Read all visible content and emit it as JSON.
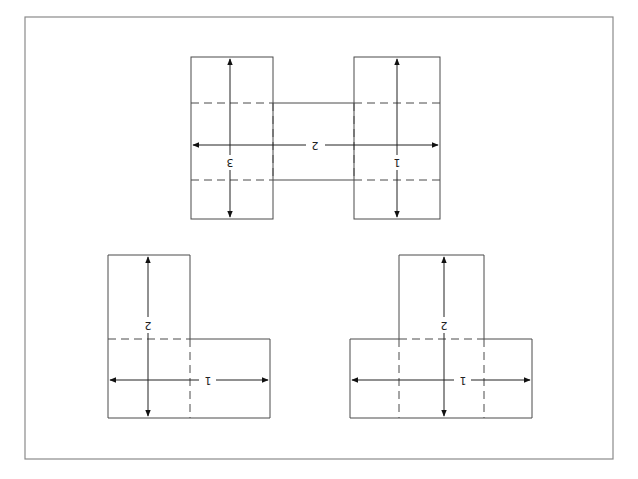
{
  "diagram": {
    "orientation_note": "labels rendered rotated 180°",
    "frame": {
      "x": 25,
      "y": 17,
      "w": 588,
      "h": 442
    },
    "shapes": [
      {
        "id": "h-shape",
        "labels": {
          "left_vertical": "3",
          "right_vertical": "1",
          "horizontal": "2"
        }
      },
      {
        "id": "l-shape",
        "labels": {
          "vertical": "2",
          "horizontal": "1"
        }
      },
      {
        "id": "t-shape",
        "labels": {
          "vertical": "2",
          "horizontal": "1"
        }
      }
    ]
  },
  "colors": {
    "line": "#4a4a4a",
    "frame": "#8a8a8a",
    "background": "#ffffff"
  }
}
